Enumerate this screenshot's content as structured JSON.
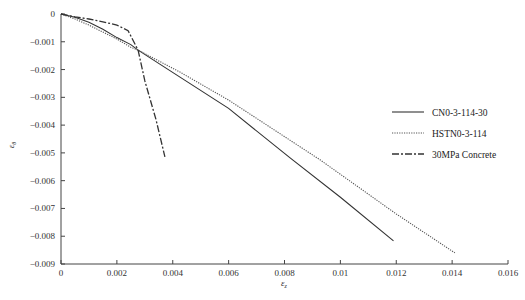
{
  "chart_data": {
    "type": "line",
    "title": "",
    "xlabel": "ε_z",
    "ylabel": "ε_θ",
    "xlim": [
      0,
      0.016
    ],
    "ylim": [
      -0.009,
      0
    ],
    "grid": false,
    "legend_position": "right",
    "x_ticks": [
      0,
      0.002,
      0.004,
      0.006,
      0.008,
      0.01,
      0.012,
      0.014,
      0.016
    ],
    "x_tick_labels": [
      "0",
      "0.002",
      "0.004",
      "0.006",
      "0.008",
      "0.01",
      "0.012",
      "0.014",
      "0.016"
    ],
    "y_ticks": [
      0,
      -0.001,
      -0.002,
      -0.003,
      -0.004,
      -0.005,
      -0.006,
      -0.007,
      -0.008,
      -0.009
    ],
    "y_tick_labels": [
      "0",
      "−0.001",
      "−0.002",
      "−0.003",
      "−0.004",
      "−0.005",
      "−0.006",
      "−0.007",
      "−0.008",
      "−0.009"
    ],
    "series": [
      {
        "name": "CN0-3-114-30",
        "style": "solid",
        "color": "#333333",
        "x": [
          0,
          0.0005,
          0.001,
          0.0015,
          0.002,
          0.0025,
          0.00276,
          0.00426,
          0.006,
          0.0082,
          0.01,
          0.0119
        ],
        "y": [
          0,
          -0.00012,
          -0.0003,
          -0.00055,
          -0.00085,
          -0.0011,
          -0.0013,
          -0.00227,
          -0.0034,
          -0.00518,
          -0.0066,
          -0.00817
        ]
      },
      {
        "name": "HSTN0-3-114",
        "style": "dotted",
        "color": "#555555",
        "x": [
          0,
          0.0005,
          0.001,
          0.0015,
          0.002,
          0.0025,
          0.00276,
          0.00426,
          0.006,
          0.00927,
          0.012,
          0.0141
        ],
        "y": [
          0,
          -0.00018,
          -0.0004,
          -0.00065,
          -0.0009,
          -0.0012,
          -0.0013,
          -0.00209,
          -0.0031,
          -0.00525,
          -0.0072,
          -0.0086
        ]
      },
      {
        "name": "30MPa Concrete",
        "style": "dashdot",
        "color": "#333333",
        "x": [
          0,
          0.0005,
          0.001,
          0.0015,
          0.002,
          0.0024,
          0.00276,
          0.003,
          0.0034,
          0.00372
        ],
        "y": [
          0,
          -0.0001,
          -0.00018,
          -0.00028,
          -0.0004,
          -0.0006,
          -0.0013,
          -0.0024,
          -0.0038,
          -0.00514
        ]
      }
    ]
  }
}
